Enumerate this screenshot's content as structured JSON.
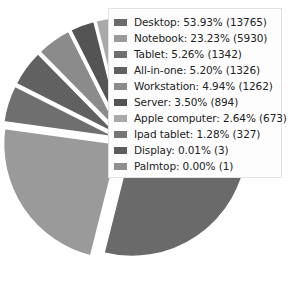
{
  "chart_data": {
    "type": "pie",
    "title": "",
    "subtitle": "",
    "xlabel": "",
    "ylabel": "",
    "legend_position": "overlay-right",
    "grid": false,
    "exploded": true,
    "start_angle_deg": 0,
    "direction": "clockwise",
    "categories": [
      "Desktop",
      "Notebook",
      "Tablet",
      "All-in-one",
      "Workstation",
      "Server",
      "Apple computer",
      "Ipad tablet",
      "Display",
      "Palmtop"
    ],
    "values": [
      13765,
      5930,
      1342,
      1326,
      1262,
      894,
      673,
      327,
      3,
      1
    ],
    "percents": [
      53.93,
      23.23,
      5.26,
      5.2,
      4.94,
      3.5,
      2.64,
      1.28,
      0.01,
      0.0
    ],
    "colors": [
      "#6a6a6a",
      "#9a9a9a",
      "#6f6f6f",
      "#616161",
      "#8b8b8b",
      "#545454",
      "#a9a9a9",
      "#767676",
      "#5d5d5d",
      "#8f8f8f"
    ],
    "slices": [
      {
        "label": "Desktop",
        "percent": 53.93,
        "count": 13765,
        "color": "#6a6a6a"
      },
      {
        "label": "Notebook",
        "percent": 23.23,
        "count": 5930,
        "color": "#9a9a9a"
      },
      {
        "label": "Tablet",
        "percent": 5.26,
        "count": 1342,
        "color": "#6f6f6f"
      },
      {
        "label": "All-in-one",
        "percent": 5.2,
        "count": 1326,
        "color": "#616161"
      },
      {
        "label": "Workstation",
        "percent": 4.94,
        "count": 1262,
        "color": "#8b8b8b"
      },
      {
        "label": "Server",
        "percent": 3.5,
        "count": 894,
        "color": "#545454"
      },
      {
        "label": "Apple computer",
        "percent": 2.64,
        "count": 673,
        "color": "#a9a9a9"
      },
      {
        "label": "Ipad tablet",
        "percent": 1.28,
        "count": 327,
        "color": "#767676"
      },
      {
        "label": "Display",
        "percent": 0.01,
        "count": 3,
        "color": "#5d5d5d"
      },
      {
        "label": "Palmtop",
        "percent": 0.0,
        "count": 1,
        "color": "#8f8f8f"
      }
    ]
  },
  "legend": {
    "entries": [
      {
        "text": "Desktop: 53.93% (13765)",
        "color": "#6a6a6a"
      },
      {
        "text": "Notebook: 23.23% (5930)",
        "color": "#9a9a9a"
      },
      {
        "text": "Tablet: 5.26% (1342)",
        "color": "#6f6f6f"
      },
      {
        "text": "All-in-one: 5.20% (1326)",
        "color": "#616161"
      },
      {
        "text": "Workstation: 4.94% (1262)",
        "color": "#8b8b8b"
      },
      {
        "text": "Server: 3.50% (894)",
        "color": "#545454"
      },
      {
        "text": "Apple computer: 2.64% (673)",
        "color": "#a9a9a9"
      },
      {
        "text": "Ipad tablet: 1.28% (327)",
        "color": "#767676"
      },
      {
        "text": "Display: 0.01% (3)",
        "color": "#5d5d5d"
      },
      {
        "text": "Palmtop: 0.00% (1)",
        "color": "#8f8f8f"
      }
    ]
  }
}
